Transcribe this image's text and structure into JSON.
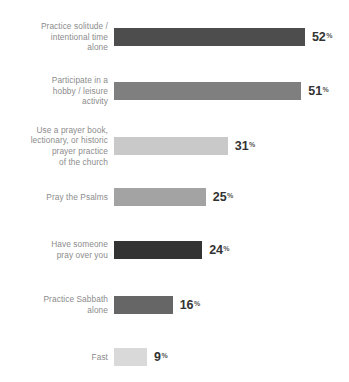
{
  "chart_data": {
    "type": "bar",
    "orientation": "horizontal",
    "title": "",
    "subtitle": "",
    "xlabel": "",
    "ylabel": "",
    "xlim": [
      0,
      60
    ],
    "grid": false,
    "legend": null,
    "value_suffix": "%",
    "categories": [
      "Practice solitude /\nintentional time\nalone",
      "Participate in a\nhobby / leisure\nactivity",
      "Use a prayer book,\nlectionary, or historic\nprayer practice\nof the church",
      "Pray the Psalms",
      "Have someone\npray over you",
      "Practice Sabbath\nalone",
      "Fast"
    ],
    "values": [
      52,
      51,
      31,
      25,
      24,
      16,
      9
    ],
    "value_labels": [
      "52",
      "51",
      "31",
      "25",
      "24",
      "16",
      "9"
    ],
    "bar_colors": [
      "#4d4d4d",
      "#7f7f7f",
      "#c9c9c9",
      "#a3a3a3",
      "#333333",
      "#666666",
      "#d9d9d9"
    ]
  },
  "style": {
    "background": "#ffffff",
    "label_color": "#8c8c8c",
    "value_color": "#333333"
  }
}
